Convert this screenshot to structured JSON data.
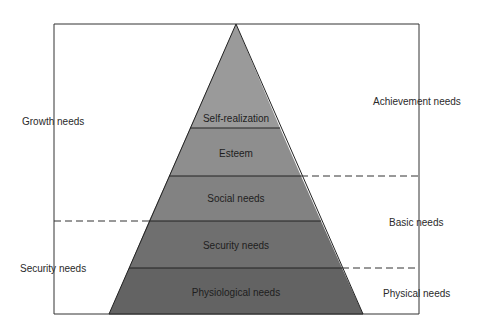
{
  "diagram": {
    "type": "pyramid",
    "layers": [
      {
        "label": "Self-realization",
        "color": "#9a9a9a"
      },
      {
        "label": "Esteem",
        "color": "#8e8e8e"
      },
      {
        "label": "Social needs",
        "color": "#828282"
      },
      {
        "label": "Security needs",
        "color": "#6f6f6f"
      },
      {
        "label": "Physiological needs",
        "color": "#636363"
      }
    ],
    "left_labels": {
      "growth": "Growth needs",
      "security": "Security needs"
    },
    "right_labels": {
      "achievement": "Achievement needs",
      "basic": "Basic needs",
      "physical": "Physical needs"
    },
    "colors": {
      "frame": "#333333",
      "divider": "#222222",
      "background": "#ffffff"
    }
  }
}
